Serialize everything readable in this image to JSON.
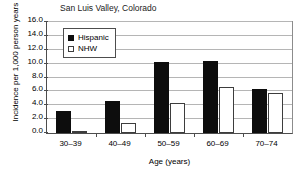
{
  "chart_data": {
    "type": "bar",
    "title": "San Luis Valley, Colorado",
    "xlabel": "Age (years)",
    "ylabel": "Incidence per 1,000 person years",
    "categories": [
      "30–39",
      "40–49",
      "50–59",
      "60–69",
      "70–74"
    ],
    "series": [
      {
        "name": "Hispanic",
        "color": "#0d0d0d",
        "values": [
          3.2,
          4.6,
          10.2,
          10.4,
          6.3
        ]
      },
      {
        "name": "NHW",
        "color": "#ffffff",
        "values": [
          0.2,
          1.5,
          4.3,
          6.6,
          5.8
        ]
      }
    ],
    "ylim": [
      0.0,
      16.0
    ],
    "ytick_labels": [
      "0.0",
      "2.0",
      "4.0",
      "6.0",
      "8.0",
      "10.0",
      "12.0",
      "14.0",
      "16.0"
    ],
    "ytick_values": [
      0.0,
      2.0,
      4.0,
      6.0,
      8.0,
      10.0,
      12.0,
      14.0,
      16.0
    ],
    "grid": "horizontal",
    "legend_position": "top-left-inside"
  },
  "legend": {
    "entries": [
      {
        "label": "Hispanic",
        "style": "filled"
      },
      {
        "label": "NHW",
        "style": "open"
      }
    ]
  }
}
